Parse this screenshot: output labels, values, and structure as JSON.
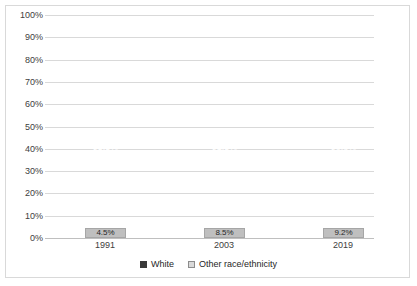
{
  "chart_data": {
    "type": "bar",
    "subtype": "stacked-100-percent",
    "title": "",
    "xlabel": "",
    "ylabel": "",
    "categories": [
      "1991",
      "2003",
      "2019"
    ],
    "series": [
      {
        "name": "White",
        "values": [
          95.5,
          91.5,
          90.8
        ],
        "labels": [
          "95.5%",
          "91.5%",
          "90.8%"
        ],
        "color": "#393939"
      },
      {
        "name": "Other race/ethnicity",
        "values": [
          4.5,
          8.5,
          9.2
        ],
        "labels": [
          "4.5%",
          "8.5%",
          "9.2%"
        ],
        "color": "#bfbfbf"
      }
    ],
    "ylim": [
      0,
      100
    ],
    "yticks": [
      "0%",
      "10%",
      "20%",
      "30%",
      "40%",
      "50%",
      "60%",
      "70%",
      "80%",
      "90%",
      "100%"
    ],
    "ytick_values": [
      0,
      10,
      20,
      30,
      40,
      50,
      60,
      70,
      80,
      90,
      100
    ],
    "grid": true,
    "legend_position": "bottom"
  },
  "axis": {
    "y_ticks": [
      {
        "label": "100%",
        "value": 100
      },
      {
        "label": "90%",
        "value": 90
      },
      {
        "label": "80%",
        "value": 80
      },
      {
        "label": "70%",
        "value": 70
      },
      {
        "label": "60%",
        "value": 60
      },
      {
        "label": "50%",
        "value": 50
      },
      {
        "label": "40%",
        "value": 40
      },
      {
        "label": "30%",
        "value": 30
      },
      {
        "label": "20%",
        "value": 20
      },
      {
        "label": "10%",
        "value": 10
      },
      {
        "label": "0%",
        "value": 0
      }
    ],
    "x_ticks": [
      {
        "label": "1991"
      },
      {
        "label": "2003"
      },
      {
        "label": "2019"
      }
    ]
  },
  "bars": [
    {
      "category": "1991",
      "white_label": "95.5%",
      "white_value": 95.5,
      "other_label": "4.5%",
      "other_value": 4.5
    },
    {
      "category": "2003",
      "white_label": "91.5%",
      "white_value": 91.5,
      "other_label": "8.5%",
      "other_value": 8.5
    },
    {
      "category": "2019",
      "white_label": "90.8%",
      "white_value": 90.8,
      "other_label": "9.2%",
      "other_value": 9.2
    }
  ],
  "legend": {
    "items": [
      {
        "label": "White",
        "color": "#393939"
      },
      {
        "label": "Other race/ethnicity",
        "color": "#d9d9d9"
      }
    ]
  },
  "colors": {
    "white_series": "#393939",
    "other_series": "#bfbfbf",
    "gridline": "#d9d9d9",
    "border": "#d9d9d9",
    "text": "#404040"
  }
}
